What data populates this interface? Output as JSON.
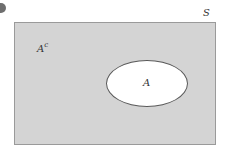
{
  "diagram": {
    "type": "venn",
    "universe": {
      "label": "S",
      "fill_color": "#d4d4d4",
      "border_color": "#9a9a9a"
    },
    "complement": {
      "base": "A",
      "superscript": "c"
    },
    "set": {
      "label": "A",
      "fill_color": "#ffffff",
      "border_color": "#5a5a5a"
    },
    "bullet": {
      "color": "#6e6e6e"
    }
  }
}
